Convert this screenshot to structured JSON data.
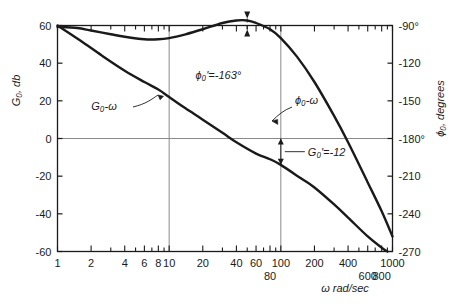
{
  "figure": {
    "name": "bode-plot",
    "background_color": "#ffffff",
    "ink_color": "#1a1a1a",
    "grid_color": "#8a8a8a"
  },
  "axes": {
    "left": {
      "label": "G₀, db",
      "ticks": [
        60,
        40,
        20,
        0,
        -20,
        -40,
        -60
      ],
      "tick_labels": [
        "60",
        "40",
        "20",
        "0",
        "-20",
        "-40",
        "-60"
      ],
      "min": -60,
      "max": 60
    },
    "right": {
      "label": "ϕ₀, degrees",
      "ticks": [
        -90,
        -120,
        -150,
        -180,
        -210,
        -240,
        -270
      ],
      "tick_labels": [
        "-90°",
        "-120",
        "-150",
        "-180°",
        "-210",
        "-240",
        "-270"
      ],
      "min": -270,
      "max": -90
    },
    "bottom": {
      "label": "ω rad/sec",
      "scale": "log",
      "min": 1,
      "max": 1000,
      "major_labels_upper": [
        {
          "value": 1,
          "text": "1"
        },
        {
          "value": 2,
          "text": "2"
        },
        {
          "value": 4,
          "text": "4"
        },
        {
          "value": 6,
          "text": "6"
        },
        {
          "value": 8,
          "text": "8"
        },
        {
          "value": 10,
          "text": "10"
        },
        {
          "value": 20,
          "text": "20"
        },
        {
          "value": 40,
          "text": "40"
        },
        {
          "value": 60,
          "text": "60"
        },
        {
          "value": 100,
          "text": "100"
        },
        {
          "value": 200,
          "text": "200"
        },
        {
          "value": 400,
          "text": "400"
        },
        {
          "value": 1000,
          "text": "1000"
        }
      ],
      "major_labels_lower": [
        {
          "value": 80,
          "text": "80"
        },
        {
          "value": 600,
          "text": "600"
        },
        {
          "value": 800,
          "text": "800"
        }
      ],
      "tick_values": [
        1,
        2,
        3,
        4,
        5,
        6,
        7,
        8,
        9,
        10,
        20,
        30,
        40,
        50,
        60,
        70,
        80,
        90,
        100,
        200,
        300,
        400,
        500,
        600,
        700,
        800,
        900,
        1000
      ]
    }
  },
  "gridlines": {
    "vertical": [
      10,
      100
    ],
    "horizontal_db": [
      0
    ]
  },
  "chart_data": {
    "type": "line",
    "title": "",
    "xlabel": "ω rad/sec",
    "ylabel": "G₀, db",
    "ylabel_right": "ϕ₀, degrees",
    "xscale": "log",
    "xlim": [
      1,
      1000
    ],
    "ylim": [
      -60,
      60
    ],
    "ylim_right": [
      -270,
      -90
    ],
    "grid": true,
    "legend": "inline-labels",
    "series": [
      {
        "name": "G₀-ω",
        "label": "G₀-ω",
        "axis": "left",
        "units": "db",
        "points": [
          {
            "w": 1,
            "db": 60
          },
          {
            "w": 1.6,
            "db": 52
          },
          {
            "w": 2.5,
            "db": 44
          },
          {
            "w": 4,
            "db": 36
          },
          {
            "w": 6,
            "db": 30
          },
          {
            "w": 8,
            "db": 26
          },
          {
            "w": 10,
            "db": 22
          },
          {
            "w": 14,
            "db": 16
          },
          {
            "w": 20,
            "db": 10
          },
          {
            "w": 30,
            "db": 3
          },
          {
            "w": 40,
            "db": -2
          },
          {
            "w": 60,
            "db": -8
          },
          {
            "w": 80,
            "db": -11
          },
          {
            "w": 100,
            "db": -14
          },
          {
            "w": 150,
            "db": -21
          },
          {
            "w": 200,
            "db": -26
          },
          {
            "w": 300,
            "db": -35
          },
          {
            "w": 400,
            "db": -42
          },
          {
            "w": 600,
            "db": -52
          },
          {
            "w": 800,
            "db": -58
          },
          {
            "w": 900,
            "db": -60
          }
        ]
      },
      {
        "name": "ϕ₀-ω",
        "label": "ϕ₀-ω",
        "axis": "right",
        "units": "degrees",
        "points": [
          {
            "w": 1,
            "deg": -91
          },
          {
            "w": 1.5,
            "deg": -92
          },
          {
            "w": 2,
            "deg": -94
          },
          {
            "w": 3,
            "deg": -97
          },
          {
            "w": 4,
            "deg": -99
          },
          {
            "w": 6,
            "deg": -101
          },
          {
            "w": 8,
            "deg": -101
          },
          {
            "w": 10,
            "deg": -100
          },
          {
            "w": 14,
            "deg": -97
          },
          {
            "w": 20,
            "deg": -93
          },
          {
            "w": 30,
            "deg": -88
          },
          {
            "w": 40,
            "deg": -86
          },
          {
            "w": 50,
            "deg": -86
          },
          {
            "w": 60,
            "deg": -88
          },
          {
            "w": 80,
            "deg": -93
          },
          {
            "w": 100,
            "deg": -100
          },
          {
            "w": 140,
            "deg": -115
          },
          {
            "w": 200,
            "deg": -135
          },
          {
            "w": 300,
            "deg": -162
          },
          {
            "w": 400,
            "deg": -183
          },
          {
            "w": 600,
            "deg": -215
          },
          {
            "w": 800,
            "deg": -238
          },
          {
            "w": 1000,
            "deg": -258
          }
        ]
      }
    ],
    "annotations": [
      {
        "name": "phase-margin",
        "text": "ϕ₀' = -163°",
        "value": -163,
        "unit": "degrees",
        "at_w": 50
      },
      {
        "name": "gain-margin",
        "text": "G₀' = -12",
        "value": -12,
        "unit": "db",
        "at_w": 100
      }
    ]
  },
  "annotations": {
    "gain_curve_label": "G₀-ω",
    "phase_curve_label": "ϕ₀-ω",
    "phase_margin_label": "ϕ₀'=-163°",
    "gain_margin_label": "G₀'=-12"
  }
}
